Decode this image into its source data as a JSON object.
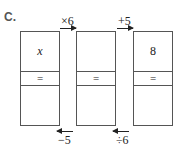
{
  "problem_label": "C.",
  "boxes": [
    {
      "top": "x",
      "middle": "=",
      "bottom": ""
    },
    {
      "top": "",
      "middle": "=",
      "bottom": ""
    },
    {
      "top": "8",
      "middle": "=",
      "bottom": ""
    }
  ],
  "forward_ops": [
    "×6",
    "+5"
  ],
  "reverse_ops": [
    "−5",
    "÷6"
  ]
}
